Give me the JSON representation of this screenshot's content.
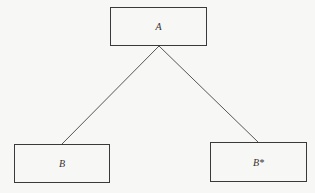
{
  "diagram": {
    "type": "tree",
    "nodes": [
      {
        "id": "A",
        "label": "A"
      },
      {
        "id": "B",
        "label": "B"
      },
      {
        "id": "Bstar",
        "label": "B*"
      }
    ],
    "edges": [
      {
        "from": "A",
        "to": "B"
      },
      {
        "from": "A",
        "to": "Bstar"
      }
    ]
  }
}
